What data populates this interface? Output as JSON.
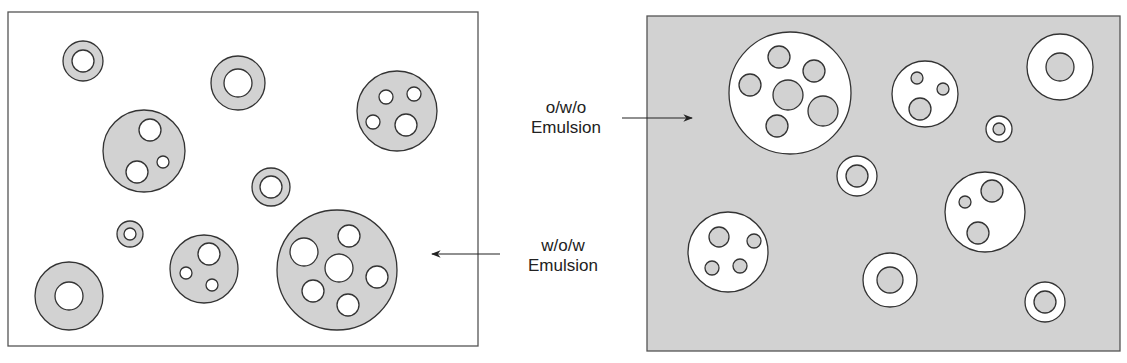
{
  "labels": {
    "owo_line1": "o/w/o",
    "owo_line2": "Emulsion",
    "wow_line1": "w/o/w",
    "wow_line2": "Emulsion"
  },
  "colors": {
    "phase_gray": "#d2d2d2",
    "phase_white": "#ffffff",
    "stroke": "#333333"
  },
  "panels": {
    "left": {
      "name": "w/o/w",
      "background": "white",
      "droplet_fill": "gray"
    },
    "right": {
      "name": "o/w/o",
      "background": "gray",
      "droplet_fill": "white"
    }
  }
}
